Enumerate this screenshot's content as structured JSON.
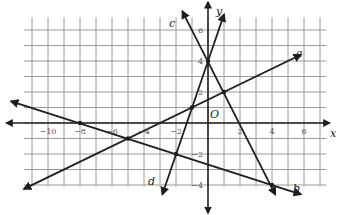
{
  "chart_data": {
    "type": "line",
    "title": "",
    "xlabel": "x",
    "ylabel": "y",
    "origin_label": "O",
    "xlim": [
      -11,
      7
    ],
    "ylim": [
      -4,
      7
    ],
    "grid": true,
    "x_ticks": [
      {
        "value": -10,
        "label": "-10"
      },
      {
        "value": -8,
        "label": "-8"
      },
      {
        "value": -6,
        "label": "-6"
      },
      {
        "value": -4,
        "label": "-4"
      },
      {
        "value": -2,
        "label": "-2"
      },
      {
        "value": 2,
        "label": "2"
      },
      {
        "value": 4,
        "label": "4"
      },
      {
        "value": 6,
        "label": "6"
      }
    ],
    "y_ticks": [
      {
        "value": 6,
        "label": "6"
      },
      {
        "value": 4,
        "label": "4"
      },
      {
        "value": 2,
        "label": "2"
      },
      {
        "value": -2,
        "label": "-2"
      },
      {
        "value": -4,
        "label": "-4"
      }
    ],
    "series": [
      {
        "name": "a",
        "equation": "y = 0.5x + 1.5",
        "slope": 0.5,
        "intercept": 1.5,
        "from": [
          -11.5,
          -4.25
        ],
        "to": [
          5.8,
          4.4
        ]
      },
      {
        "name": "b",
        "equation": "y = -x/3 - 8/3",
        "slope": -0.3333,
        "intercept": -2.6667,
        "from": [
          -12.3,
          1.4
        ],
        "to": [
          5.8,
          -4.6
        ]
      },
      {
        "name": "c",
        "equation": "y = -2x + 4",
        "slope": -2,
        "intercept": 4,
        "from": [
          -1.6,
          7.2
        ],
        "to": [
          4.2,
          -4.6
        ]
      },
      {
        "name": "d",
        "equation": "y = 3x + 4",
        "slope": 3,
        "intercept": 4,
        "from": [
          -2.85,
          -4.6
        ],
        "to": [
          1.0,
          7.0
        ]
      }
    ],
    "points": [
      {
        "x": -8,
        "y": 0
      },
      {
        "x": -5,
        "y": -1
      },
      {
        "x": -2,
        "y": -2
      },
      {
        "x": -1,
        "y": 1
      },
      {
        "x": 0,
        "y": 4
      },
      {
        "x": 1,
        "y": 2
      },
      {
        "x": 4,
        "y": -4
      }
    ]
  }
}
